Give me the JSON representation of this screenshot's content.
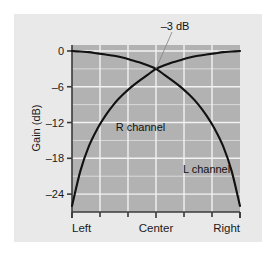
{
  "figure": {
    "panel_bg": "#e9e9e9",
    "plot_bg": "#b2b2b2",
    "grid_color": "#f2f2f2",
    "axis_color": "#3a3a3a",
    "curve_color": "#111111",
    "leader_color": "#8a8a8a"
  },
  "chart_data": {
    "type": "line",
    "title": "",
    "subtitle": "",
    "xlabel": "",
    "ylabel": "Gain (dB)",
    "xlim": [
      0,
      1
    ],
    "ylim": [
      -27,
      1
    ],
    "grid": true,
    "legend_position": "inline-annotations",
    "x_tick_labels": [
      "Left",
      "Center",
      "Right"
    ],
    "x_tick_positions": [
      0,
      0.5,
      1
    ],
    "x_minor_tick_positions": [
      0.1667,
      0.3333,
      0.6667,
      0.8333
    ],
    "y_tick_labels": [
      "0",
      "–6",
      "–12",
      "–18",
      "–24"
    ],
    "y_tick_values": [
      0,
      -6,
      -12,
      -18,
      -24
    ],
    "y_minor_gridlines": [
      -3,
      -9,
      -15,
      -21
    ],
    "annotations": [
      {
        "text": "–3 dB",
        "x": 0.5,
        "y": -3,
        "note": "crossover point where both channels are at -3 dB"
      },
      {
        "text": "R channel",
        "x": 0.26,
        "y": -13.5
      },
      {
        "text": "L channel",
        "x": 0.66,
        "y": -20.5
      }
    ],
    "series": [
      {
        "name": "R channel",
        "note": "rises from far left (-26 dB) to 0 dB at far right",
        "x": [
          0.0,
          0.05,
          0.1,
          0.15,
          0.2,
          0.25,
          0.3,
          0.35,
          0.4,
          0.45,
          0.5,
          0.55,
          0.6,
          0.65,
          0.7,
          0.75,
          0.8,
          0.85,
          0.9,
          0.95,
          1.0
        ],
        "values": [
          -26.0,
          -20.1,
          -16.0,
          -13.1,
          -10.8,
          -8.9,
          -7.4,
          -6.1,
          -5.0,
          -4.0,
          -3.0,
          -2.4,
          -1.9,
          -1.5,
          -1.1,
          -0.8,
          -0.6,
          -0.4,
          -0.2,
          -0.1,
          0.0
        ]
      },
      {
        "name": "L channel",
        "note": "falls from 0 dB at far left to -26 dB at far right",
        "x": [
          0.0,
          0.05,
          0.1,
          0.15,
          0.2,
          0.25,
          0.3,
          0.35,
          0.4,
          0.45,
          0.5,
          0.55,
          0.6,
          0.65,
          0.7,
          0.75,
          0.8,
          0.85,
          0.9,
          0.95,
          1.0
        ],
        "values": [
          0.0,
          -0.1,
          -0.2,
          -0.4,
          -0.6,
          -0.8,
          -1.1,
          -1.5,
          -1.9,
          -2.4,
          -3.0,
          -4.0,
          -5.0,
          -6.1,
          -7.4,
          -8.9,
          -10.8,
          -13.1,
          -16.0,
          -20.1,
          -26.0
        ]
      }
    ]
  }
}
